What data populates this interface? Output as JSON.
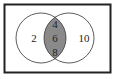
{
  "diagram": {
    "type": "venn",
    "left_only": "2",
    "right_only": "10",
    "intersection": [
      "4",
      "6",
      "8"
    ],
    "colors": {
      "border": "#222222",
      "intersection_fill": "#8a8a8a",
      "background": "#ffffff"
    }
  }
}
